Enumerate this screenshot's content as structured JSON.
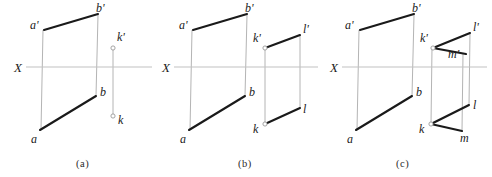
{
  "figure": {
    "width": 492,
    "height": 177,
    "background_color": "#ffffff",
    "main_line_color": "#1a1a1a",
    "projector_line_color": "#b4b4b4",
    "axis_color": "#c2c2c2",
    "marker_fill_color": "#ffffff"
  },
  "panels": [
    {
      "id": "a",
      "caption": "(a)",
      "caption_x": 76,
      "caption_y": 167,
      "axis": {
        "label": "X",
        "label_x": 14,
        "label_y": 72,
        "x1": 26,
        "x2": 152,
        "y": 67
      },
      "segments": [
        {
          "name": "a-prime-b-prime",
          "kind": "main",
          "x1": 44,
          "y1": 30,
          "x2": 98,
          "y2": 14
        },
        {
          "name": "a-b",
          "kind": "main",
          "x1": 40,
          "y1": 130,
          "x2": 96,
          "y2": 96
        },
        {
          "name": "projector-a",
          "kind": "projector",
          "x1": 43,
          "y1": 30,
          "x2": 41,
          "y2": 130
        },
        {
          "name": "projector-b",
          "kind": "projector",
          "x1": 98,
          "y1": 15,
          "x2": 96,
          "y2": 96
        },
        {
          "name": "projector-k",
          "kind": "projector",
          "x1": 113,
          "y1": 48,
          "x2": 113,
          "y2": 116
        }
      ],
      "markers": [
        {
          "name": "point-k-prime",
          "x": 113,
          "y": 48,
          "r": 2.1
        },
        {
          "name": "point-k",
          "x": 113,
          "y": 116,
          "r": 2.1
        }
      ],
      "labels": [
        {
          "name": "label-a-prime",
          "text": "a'",
          "x": 30,
          "y": 29
        },
        {
          "name": "label-b-prime",
          "text": "b'",
          "x": 96,
          "y": 12
        },
        {
          "name": "label-a",
          "text": "a",
          "x": 31,
          "y": 143
        },
        {
          "name": "label-b",
          "text": "b",
          "x": 100,
          "y": 96
        },
        {
          "name": "label-k-prime",
          "text": "k'",
          "x": 117,
          "y": 41
        },
        {
          "name": "label-k",
          "text": "k",
          "x": 118,
          "y": 124
        }
      ]
    },
    {
      "id": "b",
      "caption": "(b)",
      "caption_x": 238,
      "caption_y": 167,
      "axis": {
        "label": "X",
        "label_x": 162,
        "label_y": 72,
        "x1": 174,
        "x2": 318,
        "y": 67
      },
      "segments": [
        {
          "name": "a-prime-b-prime",
          "kind": "main",
          "x1": 193,
          "y1": 30,
          "x2": 247,
          "y2": 14
        },
        {
          "name": "a-b",
          "kind": "main",
          "x1": 189,
          "y1": 130,
          "x2": 245,
          "y2": 96
        },
        {
          "name": "k-prime-l-prime",
          "kind": "main",
          "x1": 265,
          "y1": 48,
          "x2": 300,
          "y2": 35
        },
        {
          "name": "k-l",
          "kind": "main",
          "x1": 265,
          "y1": 124,
          "x2": 300,
          "y2": 108
        },
        {
          "name": "projector-a",
          "kind": "projector",
          "x1": 192,
          "y1": 30,
          "x2": 190,
          "y2": 130
        },
        {
          "name": "projector-b",
          "kind": "projector",
          "x1": 247,
          "y1": 15,
          "x2": 245,
          "y2": 96
        },
        {
          "name": "projector-k",
          "kind": "projector",
          "x1": 265,
          "y1": 48,
          "x2": 265,
          "y2": 124
        },
        {
          "name": "projector-l",
          "kind": "projector",
          "x1": 300,
          "y1": 35,
          "x2": 300,
          "y2": 108
        }
      ],
      "markers": [
        {
          "name": "point-k-prime",
          "x": 265,
          "y": 48,
          "r": 2.1
        },
        {
          "name": "point-k",
          "x": 265,
          "y": 124,
          "r": 2.1
        }
      ],
      "labels": [
        {
          "name": "label-a-prime",
          "text": "a'",
          "x": 179,
          "y": 29
        },
        {
          "name": "label-b-prime",
          "text": "b'",
          "x": 245,
          "y": 12
        },
        {
          "name": "label-a",
          "text": "a",
          "x": 180,
          "y": 143
        },
        {
          "name": "label-b",
          "text": "b",
          "x": 249,
          "y": 96
        },
        {
          "name": "label-k-prime",
          "text": "k'",
          "x": 253,
          "y": 42
        },
        {
          "name": "label-l-prime",
          "text": "l'",
          "x": 303,
          "y": 33
        },
        {
          "name": "label-k",
          "text": "k",
          "x": 253,
          "y": 133
        },
        {
          "name": "label-l",
          "text": "l",
          "x": 303,
          "y": 113
        }
      ]
    },
    {
      "id": "c",
      "caption": "(c)",
      "caption_x": 396,
      "caption_y": 167,
      "axis": {
        "label": "X",
        "label_x": 330,
        "label_y": 72,
        "x1": 342,
        "x2": 487,
        "y": 67
      },
      "segments": [
        {
          "name": "a-prime-b-prime",
          "kind": "main",
          "x1": 360,
          "y1": 30,
          "x2": 414,
          "y2": 14
        },
        {
          "name": "a-b",
          "kind": "main",
          "x1": 356,
          "y1": 130,
          "x2": 412,
          "y2": 96
        },
        {
          "name": "k-prime-l-prime",
          "kind": "main",
          "x1": 433,
          "y1": 48,
          "x2": 470,
          "y2": 33
        },
        {
          "name": "k-prime-m-prime",
          "kind": "main",
          "x1": 433,
          "y1": 48,
          "x2": 466,
          "y2": 54
        },
        {
          "name": "k-l",
          "kind": "main",
          "x1": 431,
          "y1": 124,
          "x2": 469,
          "y2": 105
        },
        {
          "name": "k-m",
          "kind": "main",
          "x1": 431,
          "y1": 124,
          "x2": 462,
          "y2": 131
        },
        {
          "name": "projector-a",
          "kind": "projector",
          "x1": 359,
          "y1": 30,
          "x2": 357,
          "y2": 130
        },
        {
          "name": "projector-b",
          "kind": "projector",
          "x1": 414,
          "y1": 15,
          "x2": 412,
          "y2": 96
        },
        {
          "name": "projector-k",
          "kind": "projector",
          "x1": 432,
          "y1": 48,
          "x2": 431,
          "y2": 124
        },
        {
          "name": "projector-m",
          "kind": "projector",
          "x1": 463,
          "y1": 54,
          "x2": 462,
          "y2": 131
        },
        {
          "name": "projector-l",
          "kind": "projector",
          "x1": 470,
          "y1": 33,
          "x2": 469,
          "y2": 105
        }
      ],
      "markers": [
        {
          "name": "point-k-prime",
          "x": 433,
          "y": 48,
          "r": 2.1
        },
        {
          "name": "point-k",
          "x": 431,
          "y": 124,
          "r": 2.1
        }
      ],
      "labels": [
        {
          "name": "label-a-prime",
          "text": "a'",
          "x": 345,
          "y": 29
        },
        {
          "name": "label-b-prime",
          "text": "b'",
          "x": 412,
          "y": 12
        },
        {
          "name": "label-a",
          "text": "a",
          "x": 347,
          "y": 143
        },
        {
          "name": "label-b",
          "text": "b",
          "x": 416,
          "y": 96
        },
        {
          "name": "label-k-prime",
          "text": "k'",
          "x": 420,
          "y": 42
        },
        {
          "name": "label-l-prime",
          "text": "l'",
          "x": 473,
          "y": 31
        },
        {
          "name": "label-m-prime",
          "text": "m'",
          "x": 448,
          "y": 58
        },
        {
          "name": "label-k",
          "text": "k",
          "x": 419,
          "y": 133
        },
        {
          "name": "label-l",
          "text": "l",
          "x": 473,
          "y": 109
        },
        {
          "name": "label-m",
          "text": "m",
          "x": 460,
          "y": 142
        }
      ]
    }
  ]
}
